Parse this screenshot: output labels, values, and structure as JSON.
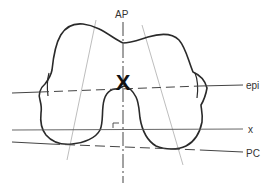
{
  "diagram": {
    "labels": {
      "ap": "AP",
      "epi": "epi",
      "x": "x",
      "pc": "PC",
      "center_mark": "X",
      "right_angle": "r"
    },
    "colors": {
      "outline": "#2a2a2a",
      "axis": "#444444",
      "thin_line": "#9a9a9a",
      "background": "#ffffff"
    },
    "lines": [
      {
        "name": "AP axis",
        "style": "dash-dot",
        "orientation": "vertical"
      },
      {
        "name": "epi",
        "style": "dashed",
        "orientation": "near-horizontal"
      },
      {
        "name": "x",
        "style": "solid",
        "orientation": "horizontal"
      },
      {
        "name": "PC",
        "style": "dashed",
        "orientation": "slightly tilted"
      },
      {
        "name": "left condyle axis",
        "style": "thin solid",
        "orientation": "oblique"
      },
      {
        "name": "right condyle axis",
        "style": "thin solid",
        "orientation": "oblique"
      }
    ]
  }
}
